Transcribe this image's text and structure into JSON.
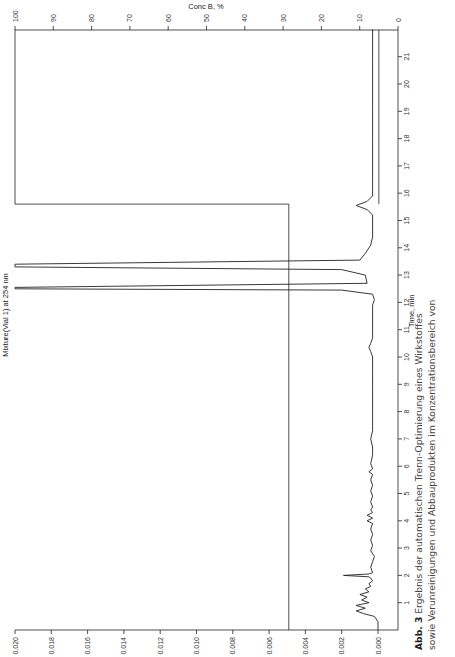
{
  "figure": {
    "caption_label": "Abb. 3",
    "caption_line1": "Ergebnis der automatischen Trenn-Optimierung eines Wirkstoffes",
    "caption_line2": "sowie Verunreinigungen und Abbauprodukten im Konzentrationsbereich von"
  },
  "chart_data": {
    "type": "line",
    "orientation": "rotated-90",
    "title": "",
    "ylabel": "Mixture(Vial 1) at 254 nm",
    "xlabel": "Time, min",
    "y2label": "Conc B, %",
    "xlim": [
      0,
      22
    ],
    "ylim": [
      0,
      0.02
    ],
    "y2lim": [
      0,
      100
    ],
    "x_ticks": [
      1,
      2,
      3,
      4,
      5,
      6,
      7,
      8,
      9,
      10,
      11,
      12,
      13,
      14,
      15,
      16,
      17,
      18,
      19,
      20,
      21
    ],
    "y_ticks": [
      "0.000",
      "0.002",
      "0.004",
      "0.006",
      "0.008",
      "0.010",
      "0.012",
      "0.014",
      "0.016",
      "0.018",
      "0.020"
    ],
    "y2_ticks": [
      "100",
      "90",
      "80",
      "70",
      "60",
      "50",
      "40",
      "30",
      "20",
      "10",
      "0"
    ],
    "grid": false,
    "series": [
      {
        "name": "Mixture(Vial 1) at 254 nm",
        "x": [
          0,
          0.3,
          0.5,
          0.6,
          0.7,
          0.8,
          0.9,
          1.0,
          1.1,
          1.2,
          1.3,
          1.4,
          1.5,
          1.6,
          1.7,
          1.8,
          1.9,
          1.95,
          2.0,
          2.05,
          2.1,
          2.3,
          2.5,
          2.7,
          2.9,
          3.1,
          3.3,
          3.5,
          3.7,
          3.9,
          4.0,
          4.1,
          4.2,
          4.3,
          4.4,
          4.5,
          4.7,
          4.9,
          5.1,
          5.3,
          5.5,
          5.7,
          5.8,
          5.9,
          6.1,
          6.4,
          6.7,
          7.0,
          7.3,
          7.6,
          8.0,
          8.5,
          9.0,
          9.5,
          10.0,
          10.2,
          10.35,
          10.5,
          10.7,
          11.0,
          11.5,
          11.9,
          12.1,
          12.3,
          12.45,
          12.5,
          12.55,
          12.7,
          13.0,
          13.2,
          13.3,
          13.4,
          13.55,
          13.8,
          14.1,
          14.4,
          14.8,
          15.2,
          15.4,
          15.55,
          15.7,
          15.9,
          16.2,
          16.6,
          17,
          18,
          19,
          20,
          21,
          22
        ],
        "y": [
          0.0,
          0.0,
          0.0002,
          0.0008,
          0.0012,
          0.0007,
          0.0012,
          0.0005,
          0.0009,
          0.0006,
          0.001,
          0.0005,
          0.0007,
          0.0004,
          0.0005,
          0.0003,
          0.0004,
          0.0005,
          0.0019,
          0.0005,
          0.0003,
          0.0004,
          0.0003,
          0.0002,
          0.0004,
          0.0003,
          0.0004,
          0.0003,
          0.0004,
          0.0003,
          0.0006,
          0.0003,
          0.0006,
          0.0003,
          0.0004,
          0.0003,
          0.0004,
          0.0003,
          0.0004,
          0.0003,
          0.0004,
          0.0003,
          0.0005,
          0.0003,
          0.0004,
          0.0003,
          0.0003,
          0.0004,
          0.0003,
          0.0003,
          0.0003,
          0.0003,
          0.0003,
          0.0003,
          0.0003,
          0.0004,
          0.0005,
          0.0004,
          0.0003,
          0.0003,
          0.0003,
          0.0003,
          0.0002,
          0.0003,
          0.002,
          0.02,
          0.02,
          0.0006,
          0.0007,
          0.002,
          0.02,
          0.02,
          0.001,
          0.0007,
          0.0004,
          0.0003,
          0.0003,
          0.0003,
          0.0006,
          0.0012,
          0.0006,
          0.0003,
          0.0003,
          0.0003,
          0.0003,
          0.0003,
          0.0003,
          0.0003,
          0.0003,
          0.0003
        ]
      },
      {
        "name": "Conc B, %",
        "x": [
          0,
          15.6,
          15.6,
          22
        ],
        "y": [
          28.5,
          28.5,
          100,
          100
        ]
      },
      {
        "name": "Gradient hold line",
        "x": [
          0,
          15.6
        ],
        "y": [
          5,
          5
        ]
      }
    ],
    "annotations": [
      "Peaks at ~12.5 min and ~13.3 min exceed scale (off-scale)"
    ]
  }
}
